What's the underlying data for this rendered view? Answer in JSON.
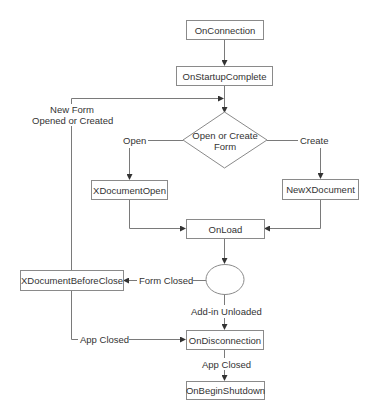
{
  "diagram": {
    "type": "flowchart",
    "nodes": {
      "on_connection": "OnConnection",
      "on_startup_complete": "OnStartupComplete",
      "decision": "Open or Create Form",
      "decision_line1": "Open or Create",
      "decision_line2": "Form",
      "xdocument_open": "XDocumentOpen",
      "new_xdocument": "NewXDocument",
      "on_load": "OnLoad",
      "xdocument_before_close": "XDocumentBeforeClose",
      "on_disconnection": "OnDisconnection",
      "on_begin_shutdown": "OnBeginShutdown"
    },
    "edge_labels": {
      "new_form_line1": "New Form",
      "new_form_line2": "Opened or Created",
      "open": "Open",
      "create": "Create",
      "form_closed": "Form Closed",
      "addin_unloaded": "Add-in Unloaded",
      "app_closed_left": "App Closed",
      "app_closed_bottom": "App Closed"
    },
    "edges": [
      {
        "from": "OnConnection",
        "to": "OnStartupComplete"
      },
      {
        "from": "OnStartupComplete",
        "to": "Open or Create Form"
      },
      {
        "from": "Open or Create Form",
        "to": "XDocumentOpen",
        "label": "Open"
      },
      {
        "from": "Open or Create Form",
        "to": "NewXDocument",
        "label": "Create"
      },
      {
        "from": "XDocumentOpen",
        "to": "OnLoad"
      },
      {
        "from": "NewXDocument",
        "to": "OnLoad"
      },
      {
        "from": "OnLoad",
        "to": "state-ellipse"
      },
      {
        "from": "state-ellipse",
        "to": "XDocumentBeforeClose",
        "label": "Form Closed"
      },
      {
        "from": "XDocumentBeforeClose",
        "to": "Open or Create Form",
        "label": "New Form Opened or Created"
      },
      {
        "from": "XDocumentBeforeClose",
        "to": "OnDisconnection",
        "label": "App Closed"
      },
      {
        "from": "state-ellipse",
        "to": "OnDisconnection",
        "label": "Add-in Unloaded"
      },
      {
        "from": "OnDisconnection",
        "to": "OnBeginShutdown",
        "label": "App Closed"
      }
    ],
    "colors": {
      "line": "#6e6e6e",
      "border": "#8a8a8a",
      "text": "#333333"
    }
  }
}
